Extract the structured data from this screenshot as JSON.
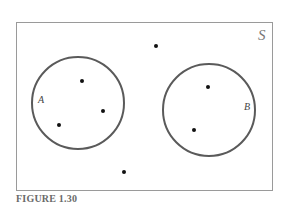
{
  "diagram": {
    "type": "venn",
    "universe_label": "S",
    "sets": [
      {
        "label": "A",
        "cx": 78,
        "cy": 103,
        "r": 46
      },
      {
        "label": "B",
        "cx": 209,
        "cy": 110,
        "r": 46
      }
    ],
    "points": [
      {
        "x": 156,
        "y": 46
      },
      {
        "x": 82,
        "y": 81
      },
      {
        "x": 103,
        "y": 111
      },
      {
        "x": 59,
        "y": 125
      },
      {
        "x": 208,
        "y": 87
      },
      {
        "x": 194,
        "y": 130
      },
      {
        "x": 124,
        "y": 172
      }
    ],
    "colors": {
      "border": "#9a9a9a",
      "circle": "#5a5a5a",
      "point": "#111111",
      "caption": "#6a6a6a"
    }
  },
  "caption": "FIGURE 1.30"
}
